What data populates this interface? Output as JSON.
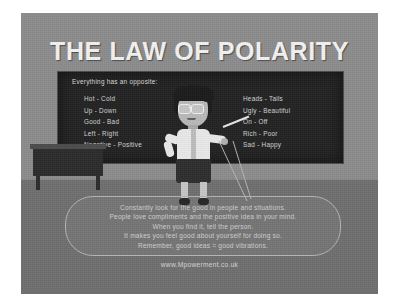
{
  "poster": {
    "title": "THE LAW OF POLARITY",
    "website": "www.Mpowerment.co.uk"
  },
  "blackboard": {
    "heading": "Everything has an opposite:",
    "left_column": [
      "Hot - Cold",
      "Up - Down",
      "Good - Bad",
      "Left - Right",
      "Negative - Positive"
    ],
    "right_column": [
      "Heads - Tails",
      "Ugly - Beautiful",
      "On - Off",
      "Rich - Poor",
      "Sad - Happy"
    ]
  },
  "speech_bubble": {
    "lines": [
      "Constantly look for the good in people and situations.",
      "People love compliments and the positive idea in your mind.",
      "When you find it, tell the person.",
      "It makes you feel good about yourself for doing so.",
      "Remember, good ideas  =  good vibrations."
    ]
  },
  "colors": {
    "wall": "#8c8c8c",
    "floor": "#6f6f6f",
    "blackboard": "#232323",
    "title_text": "#f2f2f2",
    "board_text": "#d3d3d3",
    "bubble_text": "#cfcfcf"
  }
}
